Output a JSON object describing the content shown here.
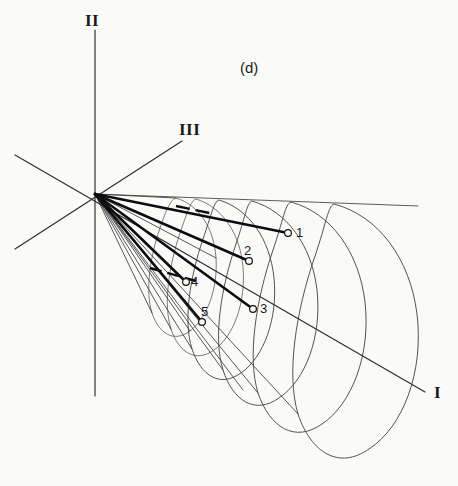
{
  "figure": {
    "panel_label": "(d)",
    "background_color": "#fafaf8",
    "ink_color": "#1a1a1a",
    "axes": [
      {
        "id": "axis-1",
        "label": "I",
        "label_x": 434,
        "label_y": 384,
        "x1": 15,
        "y1": 155,
        "x2": 425,
        "y2": 392
      },
      {
        "id": "axis-2",
        "label": "II",
        "label_x": 85,
        "label_y": 12,
        "x1": 95,
        "y1": 30,
        "x2": 95,
        "y2": 396
      },
      {
        "id": "axis-3",
        "label": "III",
        "label_x": 179,
        "label_y": 121,
        "x1": 182,
        "y1": 141,
        "x2": 15,
        "y2": 249
      }
    ],
    "origin": {
      "x": 95,
      "y": 194
    },
    "points": [
      {
        "id": "point-1",
        "label": "1",
        "label_x": 296,
        "label_y": 226,
        "cx": 288,
        "cy": 233,
        "ray_x": 95,
        "ray_y": 194
      },
      {
        "id": "point-2",
        "label": "2",
        "label_x": 244,
        "label_y": 244,
        "cx": 249,
        "cy": 261,
        "ray_x": 95,
        "ray_y": 194
      },
      {
        "id": "point-3",
        "label": "3",
        "label_x": 260,
        "label_y": 302,
        "cx": 253,
        "cy": 309,
        "ray_x": 95,
        "ray_y": 194
      },
      {
        "id": "point-4",
        "label": "4",
        "label_x": 191,
        "label_y": 275,
        "cx": 186,
        "cy": 282,
        "ray_x": 95,
        "ray_y": 194
      },
      {
        "id": "point-5",
        "label": "5",
        "label_x": 201,
        "label_y": 305,
        "cx": 202,
        "cy": 322,
        "ray_x": 95,
        "ray_y": 194
      }
    ],
    "cone": {
      "apex_x": 95,
      "apex_y": 194,
      "description": "perspective cone with nested elliptical cross-sections"
    }
  }
}
